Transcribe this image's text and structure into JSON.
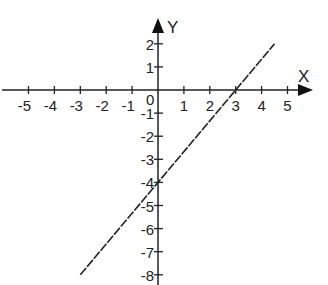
{
  "chart_data": {
    "type": "line",
    "title": "",
    "xlabel": "X",
    "ylabel": "Y",
    "origin_label": "0",
    "x_ticks": [
      -5,
      -4,
      -3,
      -2,
      -1,
      1,
      2,
      3,
      4,
      5
    ],
    "y_ticks": [
      2,
      1,
      -1,
      -2,
      -3,
      -4,
      -5,
      -6,
      -7,
      -8
    ],
    "xlim": [
      -6,
      5.6
    ],
    "ylim": [
      -8.2,
      2.8
    ],
    "grid": false,
    "legend": null,
    "series": [
      {
        "name": "y = 4/3 x - 4",
        "equation": "y = (4/3)x - 4",
        "x": [
          -3.0,
          4.5
        ],
        "y": [
          -8.0,
          2.0
        ],
        "x_intercept": 3,
        "y_intercept": -4,
        "color": "#222222"
      }
    ]
  },
  "labels": {
    "x_axis": "X",
    "y_axis": "Y",
    "origin": "0",
    "x_tick_labels": [
      "-5",
      "-4",
      "-3",
      "-2",
      "-1",
      "1",
      "2",
      "3",
      "4",
      "5"
    ],
    "y_tick_labels": [
      "2",
      "1",
      "-1",
      "-2",
      "-3",
      "-4",
      "-5",
      "-6",
      "-7",
      "-8"
    ]
  }
}
